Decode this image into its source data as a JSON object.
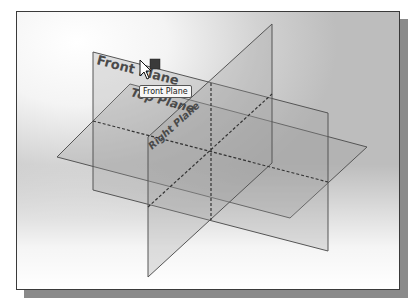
{
  "viewport": {
    "background_colors": {
      "highlight": "#ffffff",
      "shade": "#bdbdbd"
    },
    "border_color": "#3a3a3a"
  },
  "planes": [
    {
      "name": "Front Plane",
      "label": "Front Plane"
    },
    {
      "name": "Top Plane",
      "label": "Top Plane"
    },
    {
      "name": "Right Plane",
      "label": "Right Plane"
    }
  ],
  "plane_colors": {
    "fill": "#9a9a9a",
    "edge": "#555555",
    "label": "#4a4a4a",
    "dashed_axis": "#333333"
  },
  "tooltip": {
    "text": "Front Plane"
  },
  "cursor": {
    "icon": "arrow-pointer-icon",
    "selection_icon": "plane-select-icon"
  }
}
